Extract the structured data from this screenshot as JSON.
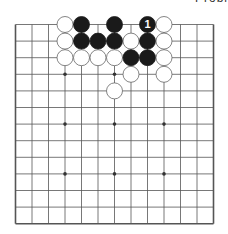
{
  "caption": "Probl",
  "board": {
    "cols": 13,
    "rows": 13,
    "origin_x": 15.5,
    "origin_y": 24.5,
    "spacing_x": 16.5,
    "spacing_y": 16.6,
    "line_color": "#555555",
    "edges": {
      "left": true,
      "right": true,
      "bottom": true,
      "top": false
    },
    "star_points": [
      [
        3,
        3
      ],
      [
        6,
        3
      ],
      [
        9,
        3
      ],
      [
        3,
        6
      ],
      [
        6,
        6
      ],
      [
        9,
        6
      ],
      [
        3,
        9
      ],
      [
        6,
        9
      ],
      [
        9,
        9
      ]
    ],
    "stones": [
      {
        "col": 3,
        "row": 0,
        "color": "white"
      },
      {
        "col": 4,
        "row": 0,
        "color": "black"
      },
      {
        "col": 6,
        "row": 0,
        "color": "black"
      },
      {
        "col": 8,
        "row": 0,
        "color": "black",
        "label": "1"
      },
      {
        "col": 9,
        "row": 0,
        "color": "white"
      },
      {
        "col": 3,
        "row": 1,
        "color": "white"
      },
      {
        "col": 4,
        "row": 1,
        "color": "black"
      },
      {
        "col": 5,
        "row": 1,
        "color": "black"
      },
      {
        "col": 6,
        "row": 1,
        "color": "black"
      },
      {
        "col": 7,
        "row": 1,
        "color": "white"
      },
      {
        "col": 8,
        "row": 1,
        "color": "black"
      },
      {
        "col": 9,
        "row": 1,
        "color": "white"
      },
      {
        "col": 3,
        "row": 2,
        "color": "white"
      },
      {
        "col": 4,
        "row": 2,
        "color": "white"
      },
      {
        "col": 5,
        "row": 2,
        "color": "white"
      },
      {
        "col": 6,
        "row": 2,
        "color": "white"
      },
      {
        "col": 7,
        "row": 2,
        "color": "black"
      },
      {
        "col": 8,
        "row": 2,
        "color": "black"
      },
      {
        "col": 9,
        "row": 2,
        "color": "white"
      },
      {
        "col": 7,
        "row": 3,
        "color": "white"
      },
      {
        "col": 9,
        "row": 3,
        "color": "white"
      },
      {
        "col": 6,
        "row": 4,
        "color": "white"
      }
    ]
  }
}
